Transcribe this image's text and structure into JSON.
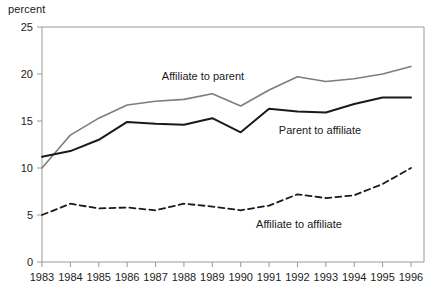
{
  "chart_data": {
    "type": "line",
    "title": "",
    "subtitle": "",
    "xlabel": "",
    "ylabel": "percent",
    "ylim": [
      0,
      25
    ],
    "yticks": [
      0,
      5,
      10,
      15,
      20,
      25
    ],
    "ytick_labels": [
      "0",
      "5",
      "10",
      "15",
      "20",
      "25"
    ],
    "grid": false,
    "legend_position": "inline-annotations",
    "categories": [
      1983,
      1984,
      1985,
      1986,
      1987,
      1988,
      1989,
      1990,
      1991,
      1992,
      1993,
      1994,
      1995,
      1996
    ],
    "xtick_labels": [
      "1983",
      "1984",
      "1985",
      "1986",
      "1987",
      "1988",
      "1989",
      "1990",
      "1991",
      "1992",
      "1993",
      "1994",
      "1995",
      "1996"
    ],
    "series": [
      {
        "name": "Affiliate to parent",
        "style": "solid",
        "color": "#7d7d7d",
        "width": 1.6,
        "values": [
          10.0,
          13.5,
          15.3,
          16.7,
          17.1,
          17.3,
          17.9,
          16.6,
          18.3,
          19.7,
          19.2,
          19.5,
          20.0,
          20.8
        ]
      },
      {
        "name": "Parent to affiliate",
        "style": "solid",
        "color": "#1a1a1a",
        "width": 2.0,
        "values": [
          11.2,
          11.8,
          13.0,
          14.9,
          14.7,
          14.6,
          15.3,
          13.8,
          16.3,
          16.0,
          15.9,
          16.8,
          17.5,
          17.5
        ]
      },
      {
        "name": "Affiliate to affiliate",
        "style": "dashed",
        "color": "#1a1a1a",
        "width": 1.8,
        "values": [
          5.0,
          6.2,
          5.7,
          5.8,
          5.5,
          6.2,
          5.9,
          5.5,
          6.0,
          7.2,
          6.8,
          7.1,
          8.3,
          10.0
        ]
      }
    ],
    "annotations": [
      {
        "text": "Affiliate to parent",
        "x": 203,
        "y": 80,
        "anchor": "middle"
      },
      {
        "text": "Parent to affiliate",
        "x": 320,
        "y": 134,
        "anchor": "middle"
      },
      {
        "text": "Affiliate to affiliate",
        "x": 299,
        "y": 228,
        "anchor": "middle"
      }
    ],
    "axis_color": "#9a9a9a"
  }
}
